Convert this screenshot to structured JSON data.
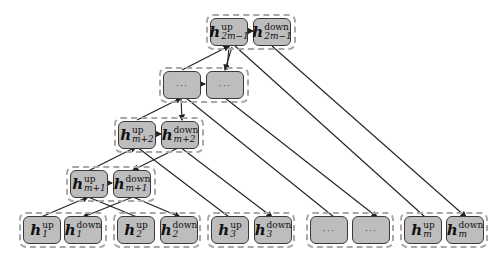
{
  "diagram": {
    "type": "binary-tree-aggregation",
    "symbol": "h",
    "levels": [
      {
        "name": "top",
        "nodes": [
          {
            "label_sup": "up",
            "label_sub": "2m−1"
          },
          {
            "label_sup": "down",
            "label_sub": "2m−1"
          }
        ]
      },
      {
        "name": "ellipsis-level",
        "nodes": [
          {
            "text": "···"
          },
          {
            "text": "···"
          }
        ]
      },
      {
        "name": "m+2",
        "nodes": [
          {
            "label_sup": "up",
            "label_sub": "m+2"
          },
          {
            "label_sup": "down",
            "label_sub": "m+2"
          }
        ]
      },
      {
        "name": "m+1",
        "nodes": [
          {
            "label_sup": "up",
            "label_sub": "m+1"
          },
          {
            "label_sup": "down",
            "label_sub": "m+1"
          }
        ]
      },
      {
        "name": "leaves",
        "groups": [
          {
            "nodes": [
              {
                "label_sup": "up",
                "label_sub": "1"
              },
              {
                "label_sup": "down",
                "label_sub": "1"
              }
            ]
          },
          {
            "nodes": [
              {
                "label_sup": "up",
                "label_sub": "2"
              },
              {
                "label_sup": "down",
                "label_sub": "2"
              }
            ]
          },
          {
            "nodes": [
              {
                "label_sup": "up",
                "label_sub": "3"
              },
              {
                "label_sup": "down",
                "label_sub": "3"
              }
            ]
          },
          {
            "nodes": [
              {
                "text": "···"
              },
              {
                "text": "···"
              }
            ]
          },
          {
            "nodes": [
              {
                "label_sup": "up",
                "label_sub": "m"
              },
              {
                "label_sup": "down",
                "label_sub": "m"
              }
            ]
          }
        ]
      }
    ],
    "colors": {
      "node_fill": "#bdbdbd",
      "node_border": "#3a3a3a",
      "group_border": "#a8a8a8",
      "edge": "#222222"
    }
  },
  "caption": ""
}
